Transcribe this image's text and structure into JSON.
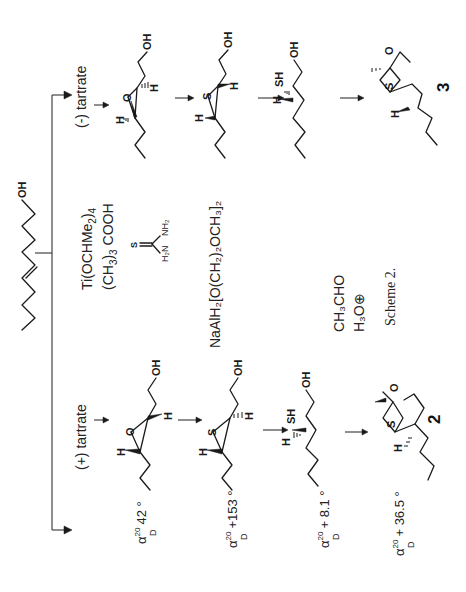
{
  "scheme": {
    "caption": "Scheme 2.",
    "orientation": "rotated 90° counter-clockwise",
    "starting_material": {
      "label": "OH",
      "description": "(E)-hex-2-en-1-ol"
    },
    "reagents": {
      "step1_line1": "Ti(OCHMe",
      "step1_line1_sub": "2",
      "step1_line1_end": ")",
      "step1_line1_sub2": "4",
      "step1_line2": "(CH",
      "step1_line2_sub": "3",
      "step1_line2_end": ")",
      "step1_line2_sub2": "3",
      "step1_line2_tail": " COOH",
      "thiourea": {
        "S": "S",
        "left": "H₂N",
        "right": "NH₂"
      },
      "step3": "NaAlH₂[O(CH₂)₂OCH₃]₂",
      "step4_line1": "CH₃CHO",
      "step4_line2": "H₃O⊕"
    },
    "branches": {
      "plus": {
        "label": "(+) tartrate",
        "compound_number": "2",
        "intermediates": [
          {
            "type": "epoxide",
            "atoms": [
              "O",
              "H",
              "H",
              "OH"
            ],
            "rotation_alpha": "α",
            "rotation_sup": "20",
            "rotation_sub": "D",
            "rotation_value": "42 °"
          },
          {
            "type": "thiirane",
            "atoms": [
              "S",
              "H",
              "H",
              "OH"
            ],
            "rotation_alpha": "α",
            "rotation_sup": "20",
            "rotation_sub": "D",
            "rotation_value": "+153 °"
          },
          {
            "type": "thiol",
            "atoms": [
              "SH",
              "H",
              "OH"
            ],
            "rotation_alpha": "α",
            "rotation_sup": "20",
            "rotation_sub": "D",
            "rotation_value": "+ 8.1 °"
          },
          {
            "type": "oxathiane",
            "atoms": [
              "O",
              "S",
              "H"
            ],
            "rotation_alpha": "α",
            "rotation_sup": "20",
            "rotation_sub": "D",
            "rotation_value": "+ 36.5 °"
          }
        ]
      },
      "minus": {
        "label": "(-) tartrate",
        "compound_number": "3",
        "intermediates": [
          {
            "type": "epoxide",
            "atoms": [
              "O",
              "H",
              "H",
              "OH"
            ]
          },
          {
            "type": "thiirane",
            "atoms": [
              "S",
              "H",
              "H",
              "OH"
            ]
          },
          {
            "type": "thiol",
            "atoms": [
              "SH",
              "H",
              "OH"
            ]
          },
          {
            "type": "oxathiane",
            "atoms": [
              "O",
              "S",
              "H"
            ]
          }
        ]
      }
    }
  }
}
